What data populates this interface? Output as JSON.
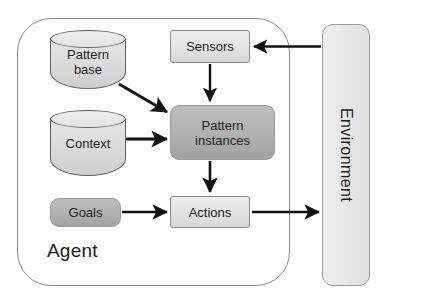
{
  "diagram": {
    "title_label": "Agent",
    "agent": {
      "label": "Agent",
      "datastores": [
        {
          "id": "pattern-base",
          "label": "Pattern\nbase",
          "line1": "Pattern",
          "line2": "base",
          "shape": "cylinder",
          "fill": "#dcdcdc"
        },
        {
          "id": "context",
          "label": "Context",
          "line1": "Context",
          "line2": "",
          "shape": "cylinder",
          "fill": "#dcdcdc"
        }
      ],
      "processes": [
        {
          "id": "sensors",
          "label": "Sensors",
          "shape": "rect",
          "fill": "#e3e3e3",
          "style": "light"
        },
        {
          "id": "pattern-instances",
          "label": "Pattern instances",
          "line1": "Pattern",
          "line2": "instances",
          "shape": "rounded-rect",
          "fill": "#b2b2b2",
          "style": "dark"
        },
        {
          "id": "goals",
          "label": "Goals",
          "shape": "rounded-rect",
          "fill": "#b2b2b2",
          "style": "dark"
        },
        {
          "id": "actions",
          "label": "Actions",
          "shape": "rect",
          "fill": "#e3e3e3",
          "style": "light"
        }
      ]
    },
    "environment": {
      "label": "Environment",
      "orientation": "vertical",
      "fill": "#e7e7e7"
    },
    "edges": [
      {
        "id": "env-to-sensors",
        "from": "Environment",
        "to": "Sensors",
        "direction": "left"
      },
      {
        "id": "sensors-to-pattern-instances",
        "from": "Sensors",
        "to": "Pattern instances",
        "direction": "down"
      },
      {
        "id": "pattern-base-to-pattern-instances",
        "from": "Pattern base",
        "to": "Pattern instances",
        "direction": "diagonal-down-right"
      },
      {
        "id": "context-to-pattern-instances",
        "from": "Context",
        "to": "Pattern instances",
        "direction": "right"
      },
      {
        "id": "pattern-instances-to-actions",
        "from": "Pattern instances",
        "to": "Actions",
        "direction": "down"
      },
      {
        "id": "goals-to-actions",
        "from": "Goals",
        "to": "Actions",
        "direction": "right"
      },
      {
        "id": "actions-to-env",
        "from": "Actions",
        "to": "Environment",
        "direction": "right"
      }
    ],
    "colors": {
      "arrow": "#121212",
      "outline": "#8a8a8a",
      "box_light": "#e3e3e3",
      "box_dark": "#b2b2b2",
      "text": "#1f1f1f",
      "background": "#fdfdfd"
    }
  }
}
